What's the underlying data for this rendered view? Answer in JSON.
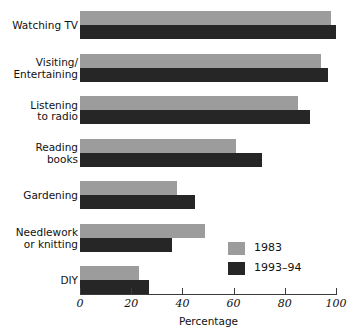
{
  "top_note": "1983 and 1993-94",
  "chart_data": {
    "type": "bar",
    "orientation": "horizontal",
    "title": "",
    "xlabel": "Percentage",
    "ylabel": "",
    "xlim": [
      0,
      100
    ],
    "xticks": [
      0,
      20,
      40,
      60,
      80,
      100
    ],
    "grid": false,
    "legend_position": "inside-lower-right",
    "categories": [
      "Watching TV",
      "Visiting/\nEntertaining",
      "Listening\nto radio",
      "Reading\nbooks",
      "Gardening",
      "Needlework\nor knitting",
      "DIY"
    ],
    "series": [
      {
        "name": "1983",
        "color": "#9c9c9c",
        "values": [
          98,
          94,
          85,
          61,
          38,
          49,
          23
        ]
      },
      {
        "name": "1993-94",
        "color": "#262626",
        "values": [
          100,
          97,
          90,
          71,
          45,
          36,
          27
        ]
      }
    ]
  },
  "legend": {
    "items": [
      {
        "label": "1983",
        "color": "#9c9c9c"
      },
      {
        "label": "1993–94",
        "color": "#262626"
      }
    ]
  },
  "axis": {
    "tick_labels": [
      "0",
      "20",
      "40",
      "60",
      "80",
      "100"
    ],
    "title": "Percentage"
  }
}
